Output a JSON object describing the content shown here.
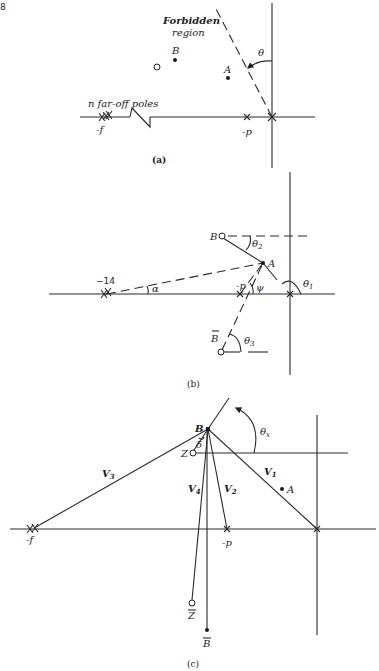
{
  "page": {
    "page_number_fragment": "8"
  },
  "figure_a": {
    "caption": "(a)",
    "region_label_line1": "Forbidden",
    "region_label_line2": "region",
    "angle_label": "θ",
    "point_a": "A",
    "point_b": "B",
    "far_poles_label": "n far-off poles",
    "pole_f_label": "-f",
    "pole_p_label": "-p"
  },
  "figure_b": {
    "caption": "(b)",
    "pole_14_label": "−14",
    "pole_p_label": "-p",
    "point_a": "A",
    "point_b": "B",
    "point_b_conj": "B",
    "angle_alpha": "α",
    "angle_psi": "ψ",
    "angle_theta1": "θ",
    "angle_theta1_sub": "1",
    "angle_theta2": "θ",
    "angle_theta2_sub": "2",
    "angle_theta3": "θ",
    "angle_theta3_sub": "3"
  },
  "figure_c": {
    "caption": "(c)",
    "point_b": "B",
    "point_z": "Z",
    "point_a": "A",
    "point_z_conj": "Z",
    "point_b_conj": "B",
    "pole_f_label": "-f",
    "pole_p_label": "-p",
    "angle_delta": "δ",
    "angle_theta_x": "θ",
    "angle_theta_x_sub": "x",
    "vec_v1": "V",
    "vec_v1_sub": "1",
    "vec_v2": "V",
    "vec_v2_sub": "2",
    "vec_v3": "V",
    "vec_v3_sub": "3",
    "vec_v4": "V",
    "vec_v4_sub": "4"
  }
}
